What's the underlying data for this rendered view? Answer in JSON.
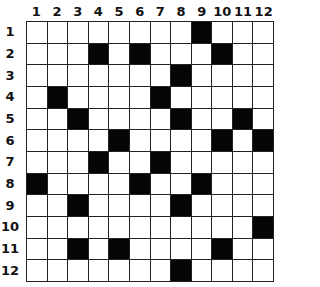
{
  "puzzle": {
    "type": "12x12 grid",
    "rows": 12,
    "cols": 12,
    "column_labels": [
      "1",
      "2",
      "3",
      "4",
      "5",
      "6",
      "7",
      "8",
      "9",
      "10",
      "11",
      "12"
    ],
    "row_labels": [
      "1",
      "2",
      "3",
      "4",
      "5",
      "6",
      "7",
      "8",
      "9",
      "10",
      "11",
      "12"
    ],
    "black_cells": [
      {
        "row": 1,
        "cols": [
          9
        ]
      },
      {
        "row": 2,
        "cols": [
          4,
          6,
          10
        ]
      },
      {
        "row": 3,
        "cols": [
          8
        ]
      },
      {
        "row": 4,
        "cols": [
          2,
          7
        ]
      },
      {
        "row": 5,
        "cols": [
          3,
          8,
          11
        ]
      },
      {
        "row": 6,
        "cols": [
          5,
          10,
          12
        ]
      },
      {
        "row": 7,
        "cols": [
          4,
          7
        ]
      },
      {
        "row": 8,
        "cols": [
          1,
          6,
          9
        ]
      },
      {
        "row": 9,
        "cols": [
          3,
          8
        ]
      },
      {
        "row": 10,
        "cols": [
          12
        ]
      },
      {
        "row": 11,
        "cols": [
          3,
          5,
          10
        ]
      },
      {
        "row": 12,
        "cols": [
          8
        ]
      }
    ],
    "colors": {
      "black_cell": "#050505",
      "white_cell": "#ffffff",
      "grid_line": "#222222"
    }
  }
}
